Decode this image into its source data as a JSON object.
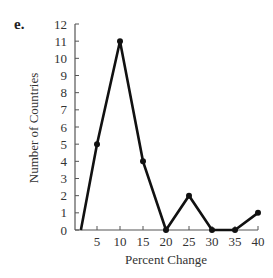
{
  "figure": {
    "part_label": "e."
  },
  "chart_data": {
    "type": "line",
    "title": "",
    "xlabel": "Percent Change",
    "ylabel": "Number of Countries",
    "x_ticks": [
      5,
      10,
      15,
      20,
      25,
      30,
      35,
      40
    ],
    "y_ticks": [
      0,
      1,
      2,
      3,
      4,
      5,
      6,
      7,
      8,
      9,
      10,
      11,
      12
    ],
    "xlim": [
      0,
      40
    ],
    "ylim": [
      0,
      12
    ],
    "grid": false,
    "legend": null,
    "series": [
      {
        "name": "Frequency polygon",
        "start_point": {
          "x": 1.5,
          "y": 0,
          "marker": false
        },
        "x": [
          5,
          10,
          15,
          20,
          25,
          30,
          35,
          40
        ],
        "y": [
          5,
          11,
          4,
          0,
          2,
          0,
          0,
          1
        ],
        "color": "#111111"
      }
    ]
  }
}
